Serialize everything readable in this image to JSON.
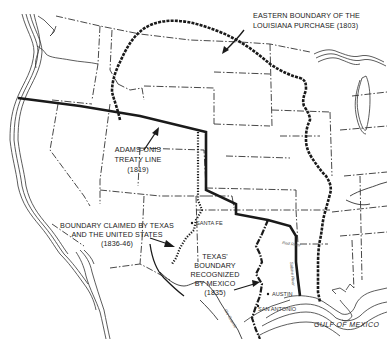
{
  "map": {
    "title": "",
    "labels": {
      "louisiana": {
        "line1": "EASTERN BOUNDARY OF THE",
        "line2": "LOUISIANA PURCHASE (1803)"
      },
      "adams_onis": {
        "line1": "ADAMS-ONIS",
        "line2": "TREATY LINE",
        "line3": "(1819)"
      },
      "texas_claim": {
        "line1": "BOUNDARY CLAIMED BY TEXAS",
        "line2": "AND THE UNITED STATES",
        "line3": "(1836-46)"
      },
      "texas_mexico": {
        "line1": "TEXAS'",
        "line2": "BOUNDARY",
        "line3": "RECOGNIZED",
        "line4": "BY MEXICO",
        "line5": "(1835)"
      }
    },
    "cities": [
      {
        "name": "SANTA FE"
      },
      {
        "name": "AUSTIN"
      },
      {
        "name": "SAN ANTONIO"
      }
    ],
    "rivers": [
      {
        "name": "Red River"
      },
      {
        "name": "Sabine River"
      },
      {
        "name": "Rio Grande"
      }
    ],
    "water_bodies": [
      {
        "name": "GULF OF MEXICO"
      }
    ],
    "colors": {
      "ink": "#1a1a1a",
      "background": "#ffffff"
    }
  }
}
